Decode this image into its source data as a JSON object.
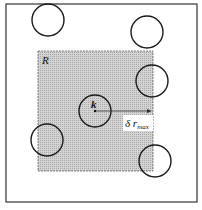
{
  "diagram": {
    "region_label": "R",
    "center_label": "k",
    "radius_label_main": "δ r",
    "radius_label_sub": "max",
    "colors": {
      "region_fill": "#c8c8c8",
      "stroke": "#1a1a1a",
      "background": "#ffffff"
    },
    "circles": [
      {
        "cx": 48,
        "cy": 20,
        "r": 16
      },
      {
        "cx": 147,
        "cy": 32,
        "r": 16
      },
      {
        "cx": 152,
        "cy": 81,
        "r": 16
      },
      {
        "cx": 95,
        "cy": 111,
        "r": 16
      },
      {
        "cx": 47,
        "cy": 140,
        "r": 16
      },
      {
        "cx": 155,
        "cy": 161,
        "r": 16
      }
    ]
  }
}
